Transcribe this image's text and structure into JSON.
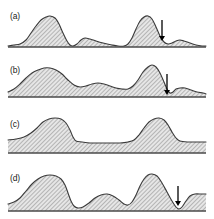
{
  "figure": {
    "type": "multi-panel-profile-figure",
    "panel_count": 4,
    "background": "#ffffff",
    "curve_color": "#3a3a3a",
    "fill_pattern": "diagonal-hatch",
    "fill_color": "#d9d9d9",
    "hatch_color": "#8a8a8a",
    "baseline_color": "#4a4a4a",
    "arrow_color": "#000000"
  },
  "panels": [
    {
      "id": "a",
      "label": "(a)",
      "label_x": 10,
      "label_y": 12,
      "arrow": {
        "present": true,
        "x": 162,
        "y_top": 20,
        "y_bottom": 41
      },
      "description": "Low flat baseline with one tall left peak, a small secondary bump, a tall right peak and a small right shoulder bump",
      "profile": [
        [
          8,
          46
        ],
        [
          14,
          45
        ],
        [
          20,
          44
        ],
        [
          26,
          40
        ],
        [
          31,
          33
        ],
        [
          36,
          26
        ],
        [
          41,
          20
        ],
        [
          46,
          17
        ],
        [
          50,
          16
        ],
        [
          55,
          18
        ],
        [
          59,
          24
        ],
        [
          63,
          33
        ],
        [
          67,
          41
        ],
        [
          70,
          45
        ],
        [
          73,
          46
        ],
        [
          77,
          44
        ],
        [
          81,
          40
        ],
        [
          85,
          38
        ],
        [
          90,
          39
        ],
        [
          96,
          41
        ],
        [
          103,
          43
        ],
        [
          112,
          45
        ],
        [
          118,
          46
        ],
        [
          124,
          46
        ],
        [
          128,
          44
        ],
        [
          132,
          38
        ],
        [
          136,
          29
        ],
        [
          140,
          21
        ],
        [
          144,
          17
        ],
        [
          148,
          16
        ],
        [
          152,
          19
        ],
        [
          156,
          27
        ],
        [
          160,
          36
        ],
        [
          164,
          42
        ],
        [
          168,
          44
        ],
        [
          172,
          43
        ],
        [
          176,
          41
        ],
        [
          180,
          40
        ],
        [
          184,
          41
        ],
        [
          190,
          43
        ],
        [
          196,
          45
        ],
        [
          202,
          46
        ],
        [
          206,
          46
        ]
      ],
      "baseline_y": 47
    },
    {
      "id": "b",
      "label": "(b)",
      "label_x": 10,
      "label_y": 66,
      "arrow": {
        "present": true,
        "x": 167,
        "y_top": 74,
        "y_bottom": 95
      },
      "description": "Raised baseline shelf with broad left hump, a mid plateau bump, a tall right peak and a notch at the arrow",
      "profile": [
        [
          8,
          92
        ],
        [
          14,
          89
        ],
        [
          20,
          84
        ],
        [
          26,
          78
        ],
        [
          32,
          73
        ],
        [
          38,
          70
        ],
        [
          44,
          68
        ],
        [
          50,
          68
        ],
        [
          56,
          70
        ],
        [
          62,
          74
        ],
        [
          68,
          80
        ],
        [
          74,
          85
        ],
        [
          80,
          87
        ],
        [
          86,
          86
        ],
        [
          92,
          84
        ],
        [
          98,
          83
        ],
        [
          104,
          84
        ],
        [
          110,
          86
        ],
        [
          116,
          88
        ],
        [
          122,
          89
        ],
        [
          128,
          89
        ],
        [
          133,
          86
        ],
        [
          138,
          80
        ],
        [
          143,
          72
        ],
        [
          148,
          67
        ],
        [
          152,
          65
        ],
        [
          156,
          67
        ],
        [
          160,
          73
        ],
        [
          164,
          82
        ],
        [
          167,
          89
        ],
        [
          170,
          93
        ],
        [
          173,
          92
        ],
        [
          176,
          89
        ],
        [
          180,
          88
        ],
        [
          185,
          88
        ],
        [
          191,
          90
        ],
        [
          197,
          92
        ],
        [
          203,
          93
        ],
        [
          206,
          94
        ]
      ],
      "baseline_y": 97
    },
    {
      "id": "c",
      "label": "(c)",
      "label_x": 10,
      "label_y": 120,
      "arrow": {
        "present": false
      },
      "description": "Thick elevated slab with two smooth broad humps, left hump and right hump, no arrow",
      "profile": [
        [
          8,
          140
        ],
        [
          16,
          139
        ],
        [
          24,
          137
        ],
        [
          31,
          133
        ],
        [
          37,
          128
        ],
        [
          43,
          122
        ],
        [
          49,
          119
        ],
        [
          55,
          118
        ],
        [
          61,
          119
        ],
        [
          66,
          123
        ],
        [
          70,
          130
        ],
        [
          73,
          137
        ],
        [
          76,
          141
        ],
        [
          82,
          142
        ],
        [
          90,
          143
        ],
        [
          100,
          143
        ],
        [
          110,
          143
        ],
        [
          120,
          143
        ],
        [
          128,
          142
        ],
        [
          134,
          140
        ],
        [
          139,
          135
        ],
        [
          144,
          128
        ],
        [
          149,
          122
        ],
        [
          154,
          119
        ],
        [
          159,
          118
        ],
        [
          164,
          120
        ],
        [
          168,
          125
        ],
        [
          172,
          132
        ],
        [
          176,
          138
        ],
        [
          180,
          141
        ],
        [
          188,
          142
        ],
        [
          196,
          142
        ],
        [
          204,
          142
        ],
        [
          206,
          142
        ]
      ],
      "baseline_y": 153
    },
    {
      "id": "d",
      "label": "(d)",
      "label_x": 10,
      "label_y": 174,
      "arrow": {
        "present": true,
        "x": 178,
        "y_top": 186,
        "y_bottom": 206
      },
      "description": "Elevated base with tall left hump, a mid rounded hump, a tall right peak, a deep notch at the arrow and a right shelf",
      "profile": [
        [
          8,
          204
        ],
        [
          14,
          202
        ],
        [
          20,
          198
        ],
        [
          26,
          191
        ],
        [
          32,
          184
        ],
        [
          38,
          179
        ],
        [
          44,
          176
        ],
        [
          50,
          175
        ],
        [
          56,
          176
        ],
        [
          61,
          179
        ],
        [
          65,
          185
        ],
        [
          68,
          193
        ],
        [
          71,
          201
        ],
        [
          74,
          206
        ],
        [
          78,
          208
        ],
        [
          83,
          207
        ],
        [
          89,
          203
        ],
        [
          95,
          198
        ],
        [
          101,
          195
        ],
        [
          107,
          194
        ],
        [
          113,
          196
        ],
        [
          119,
          200
        ],
        [
          124,
          204
        ],
        [
          128,
          205
        ],
        [
          132,
          202
        ],
        [
          136,
          195
        ],
        [
          140,
          186
        ],
        [
          144,
          179
        ],
        [
          148,
          175
        ],
        [
          152,
          174
        ],
        [
          157,
          176
        ],
        [
          162,
          183
        ],
        [
          167,
          192
        ],
        [
          172,
          201
        ],
        [
          176,
          207
        ],
        [
          179,
          209
        ],
        [
          182,
          207
        ],
        [
          186,
          201
        ],
        [
          190,
          196
        ],
        [
          195,
          194
        ],
        [
          201,
          194
        ],
        [
          206,
          194
        ]
      ],
      "baseline_y": 211
    }
  ]
}
